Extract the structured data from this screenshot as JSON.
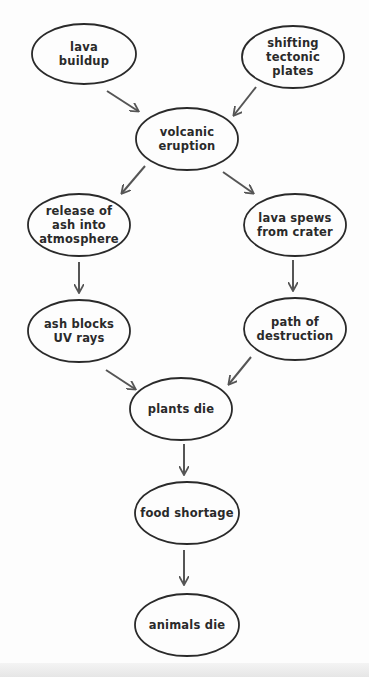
{
  "diagram": {
    "type": "flowchart",
    "title": "",
    "colors": {
      "stroke": "#2a2a2a",
      "arrow": "#555555",
      "text": "#2a2a2a",
      "background": "#fdfdfd"
    },
    "nodes": [
      {
        "id": "lava_buildup",
        "label": "lava\nbuildup"
      },
      {
        "id": "tectonic",
        "label": "shifting\ntectonic\nplates"
      },
      {
        "id": "eruption",
        "label": "volcanic\neruption"
      },
      {
        "id": "ash_release",
        "label": "release of\nash into\natmosphere"
      },
      {
        "id": "lava_spews",
        "label": "lava spews\nfrom crater"
      },
      {
        "id": "ash_blocks",
        "label": "ash blocks\nUV rays"
      },
      {
        "id": "destruction",
        "label": "path of\ndestruction"
      },
      {
        "id": "plants_die",
        "label": "plants die"
      },
      {
        "id": "food_shortage",
        "label": "food shortage"
      },
      {
        "id": "animals_die",
        "label": "animals die"
      }
    ],
    "edges": [
      {
        "from": "lava_buildup",
        "to": "eruption"
      },
      {
        "from": "tectonic",
        "to": "eruption"
      },
      {
        "from": "eruption",
        "to": "ash_release"
      },
      {
        "from": "eruption",
        "to": "lava_spews"
      },
      {
        "from": "ash_release",
        "to": "ash_blocks"
      },
      {
        "from": "lava_spews",
        "to": "destruction"
      },
      {
        "from": "ash_blocks",
        "to": "plants_die"
      },
      {
        "from": "destruction",
        "to": "plants_die"
      },
      {
        "from": "plants_die",
        "to": "food_shortage"
      },
      {
        "from": "food_shortage",
        "to": "animals_die"
      }
    ]
  }
}
